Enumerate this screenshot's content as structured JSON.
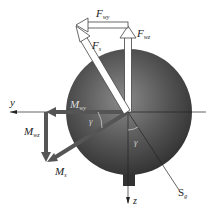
{
  "diagram": {
    "type": "force-moment-decomposition",
    "labels": {
      "F_wy": {
        "main": "F",
        "sub": "wy"
      },
      "F_wz": {
        "main": "F",
        "sub": "wz"
      },
      "F_s": {
        "main": "F",
        "sub": "s"
      },
      "M_wy": {
        "main": "M",
        "sub": "wy"
      },
      "M_wz": {
        "main": "M",
        "sub": "wz"
      },
      "M_s": {
        "main": "M",
        "sub": "s"
      },
      "axis_y": "y",
      "axis_z": "z",
      "S_g": {
        "main": "S",
        "sub": "g"
      },
      "gamma_1": "γ",
      "gamma_2": "γ"
    },
    "colors": {
      "disc_dark": "#3a3a3a",
      "disc_light": "#8a8a8a",
      "moment_arrow": "#555555",
      "force_arrow_fill": "#ffffff",
      "force_arrow_stroke": "#444444",
      "axis": "#222222"
    }
  }
}
